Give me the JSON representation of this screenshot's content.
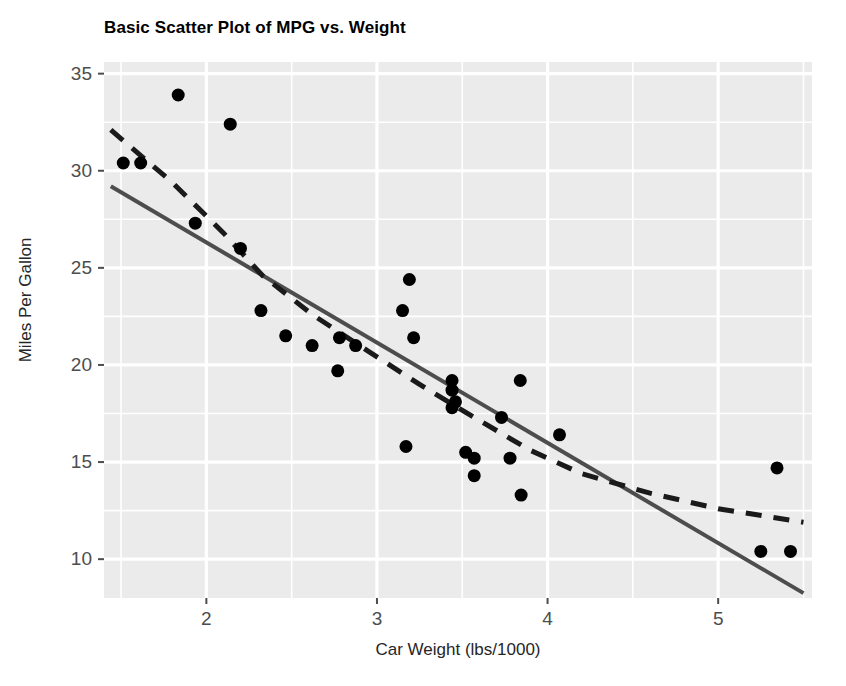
{
  "chart_data": {
    "type": "scatter",
    "title": "Basic Scatter Plot of MPG vs. Weight",
    "xlabel": "Car Weight (lbs/1000)",
    "ylabel": "Miles Per Gallon",
    "xlim": [
      1.4,
      5.55
    ],
    "ylim": [
      8.0,
      35.6
    ],
    "xticks": [
      2,
      3,
      4,
      5
    ],
    "yticks": [
      10,
      15,
      20,
      25,
      30,
      35
    ],
    "xtick_labels": [
      "2",
      "3",
      "4",
      "5"
    ],
    "ytick_labels": [
      "10",
      "15",
      "20",
      "25",
      "30",
      "35"
    ],
    "x_minor_ticks": [
      1.5,
      2.5,
      3.5,
      4.5,
      5.5
    ],
    "y_minor_ticks": [
      12.5,
      17.5,
      22.5,
      27.5,
      32.5
    ],
    "grid": true,
    "legend": "none",
    "panel_background": "#ebebeb",
    "gridline_color": "#ffffff",
    "point_color": "#000000",
    "point_size": 6.5,
    "points": [
      {
        "x": 1.513,
        "y": 30.4
      },
      {
        "x": 1.615,
        "y": 30.4
      },
      {
        "x": 1.835,
        "y": 33.9
      },
      {
        "x": 1.935,
        "y": 27.3
      },
      {
        "x": 2.14,
        "y": 32.4
      },
      {
        "x": 2.2,
        "y": 26.0
      },
      {
        "x": 2.32,
        "y": 22.8
      },
      {
        "x": 2.465,
        "y": 21.5
      },
      {
        "x": 2.62,
        "y": 21.0
      },
      {
        "x": 2.77,
        "y": 19.7
      },
      {
        "x": 2.78,
        "y": 21.4
      },
      {
        "x": 2.875,
        "y": 21.0
      },
      {
        "x": 3.15,
        "y": 22.8
      },
      {
        "x": 3.17,
        "y": 15.8
      },
      {
        "x": 3.19,
        "y": 24.4
      },
      {
        "x": 3.215,
        "y": 21.4
      },
      {
        "x": 3.44,
        "y": 19.2
      },
      {
        "x": 3.44,
        "y": 18.7
      },
      {
        "x": 3.44,
        "y": 17.8
      },
      {
        "x": 3.46,
        "y": 18.1
      },
      {
        "x": 3.52,
        "y": 15.5
      },
      {
        "x": 3.57,
        "y": 14.3
      },
      {
        "x": 3.57,
        "y": 15.2
      },
      {
        "x": 3.73,
        "y": 17.3
      },
      {
        "x": 3.78,
        "y": 15.2
      },
      {
        "x": 3.84,
        "y": 19.2
      },
      {
        "x": 3.845,
        "y": 13.3
      },
      {
        "x": 4.07,
        "y": 16.4
      },
      {
        "x": 5.25,
        "y": 10.4
      },
      {
        "x": 5.345,
        "y": 14.7
      },
      {
        "x": 5.424,
        "y": 10.4
      }
    ],
    "fit_lines": [
      {
        "name": "linear-fit-solid",
        "style": "solid",
        "color": "#4d4d4d",
        "width": 4,
        "x1": 1.44,
        "y1": 29.2,
        "x2": 5.5,
        "y2": 8.25
      },
      {
        "name": "loess-fit-dashed",
        "style": "dashed",
        "color": "#1a1a1a",
        "width": 5,
        "dash_pattern": "16 12",
        "points": [
          {
            "x": 1.44,
            "y": 32.1
          },
          {
            "x": 1.8,
            "y": 29.4
          },
          {
            "x": 2.1,
            "y": 26.8
          },
          {
            "x": 2.33,
            "y": 24.6
          },
          {
            "x": 2.62,
            "y": 22.6
          },
          {
            "x": 2.95,
            "y": 20.7
          },
          {
            "x": 3.25,
            "y": 19.0
          },
          {
            "x": 3.55,
            "y": 17.4
          },
          {
            "x": 3.9,
            "y": 15.6
          },
          {
            "x": 4.2,
            "y": 14.4
          },
          {
            "x": 4.6,
            "y": 13.4
          },
          {
            "x": 5.0,
            "y": 12.6
          },
          {
            "x": 5.5,
            "y": 11.9
          }
        ]
      }
    ]
  },
  "axis": {
    "y_title": "Miles Per Gallon",
    "x_title": "Car Weight (lbs/1000)",
    "y_labels": [
      "35",
      "30",
      "25",
      "20",
      "15",
      "10"
    ],
    "x_labels": [
      "2",
      "3",
      "4",
      "5"
    ]
  },
  "header": {
    "title": "Basic Scatter Plot of MPG vs. Weight"
  }
}
